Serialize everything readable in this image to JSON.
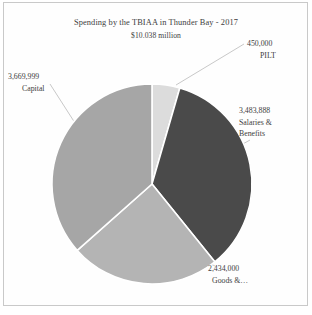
{
  "chart_data": {
    "type": "pie",
    "title": "Spending by the TBIAA in Thunder Bay - 2017",
    "subtitle": "$10.038 million",
    "categories": [
      "PILT",
      "Salaries & Benefits",
      "Goods &…",
      "Capital"
    ],
    "values": [
      450000,
      3483888,
      2434000,
      3669999
    ],
    "value_labels": [
      "450,000",
      "3,483,888",
      "2,434,000",
      "3,669,999"
    ],
    "total": 10037887,
    "total_label": "$10.038 million",
    "percentages": [
      4.5,
      34.7,
      24.2,
      36.6
    ],
    "colors": [
      "#dcdcdc",
      "#4a4a4a",
      "#b4b4b4",
      "#a6a6a6"
    ],
    "slice_border_color": "#ffffff",
    "legend": "none",
    "labels_position": "outside-with-leader-lines",
    "grid": false,
    "start_angle_deg": -90
  },
  "labels": {
    "pilt": {
      "value": "450,000",
      "name": "PILT"
    },
    "salaries": {
      "value": "3,483,888",
      "name_line1": "Salaries &",
      "name_line2": "Benefits"
    },
    "goods": {
      "value": "2,434,000",
      "name": "Goods &…"
    },
    "capital": {
      "value": "3,669,999",
      "name": "Capital"
    }
  }
}
